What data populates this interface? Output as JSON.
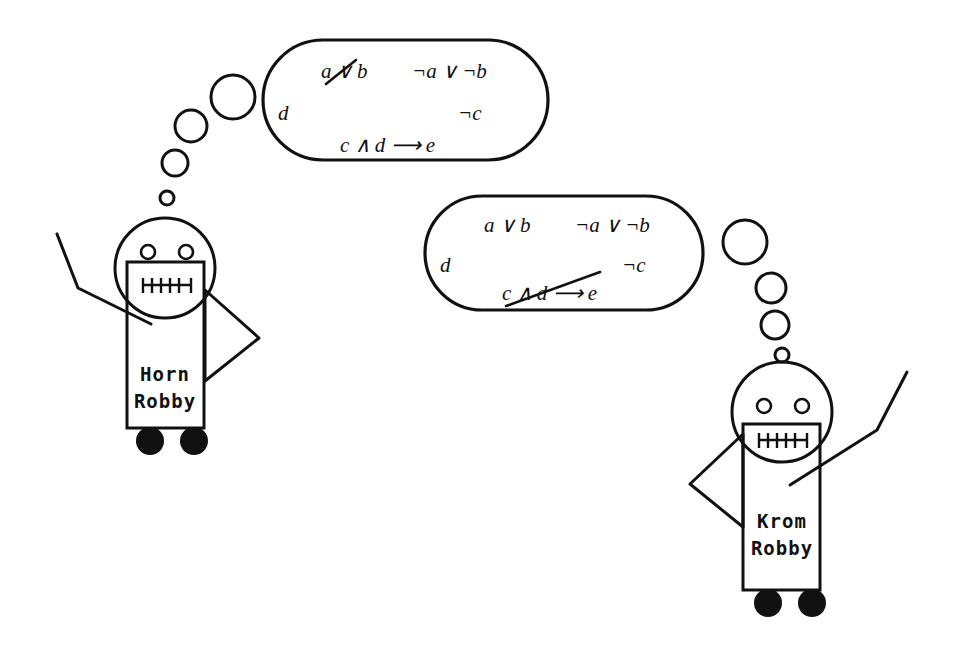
{
  "scene": {
    "title": "Horn Robby and Krom Robby thought bubbles",
    "width": 955,
    "height": 646,
    "background": "#ffffff",
    "ink_color": "#111111"
  },
  "robots": [
    {
      "id": "horn-robby",
      "name_line1": "Horn",
      "name_line2": "Robby",
      "side": "left",
      "wheels": 2
    },
    {
      "id": "krom-robby",
      "name_line1": "Krom",
      "name_line2": "Robby",
      "side": "right",
      "wheels": 2
    }
  ],
  "bubbles": [
    {
      "id": "horn-bubble",
      "owner": "horn-robby",
      "trail_dots": 4,
      "lines": [
        {
          "id": "line-1-left",
          "text": "a ∨ b",
          "struck": true,
          "strike_target": "∨"
        },
        {
          "id": "line-1-right",
          "text": "¬a ∨ ¬b",
          "struck": false
        },
        {
          "id": "line-2-left",
          "text": "d",
          "struck": false
        },
        {
          "id": "line-2-right",
          "text": "¬c",
          "struck": false
        },
        {
          "id": "line-3-center",
          "text": "c ∧ d ⟶ e",
          "struck": false
        }
      ]
    },
    {
      "id": "krom-bubble",
      "owner": "krom-robby",
      "trail_dots": 4,
      "lines": [
        {
          "id": "line-1-left",
          "text": "a ∨ b",
          "struck": false
        },
        {
          "id": "line-1-right",
          "text": "¬a ∨ ¬b",
          "struck": false
        },
        {
          "id": "line-2-left",
          "text": "d",
          "struck": false
        },
        {
          "id": "line-2-right",
          "text": "¬c",
          "struck": false
        },
        {
          "id": "line-3-center",
          "text": "c ∧ d ⟶ e",
          "struck": true,
          "strike_target": "∧ d"
        }
      ]
    }
  ],
  "glyphs": {
    "or": "∨",
    "and": "∧",
    "not": "¬",
    "implies": "⟶",
    "a": "a",
    "b": "b",
    "c": "c",
    "d": "d",
    "e": "e"
  }
}
